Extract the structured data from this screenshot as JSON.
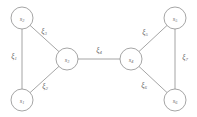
{
  "figure": {
    "type": "undirected-graph-diagram",
    "width": 197,
    "height": 117,
    "background_color": "#ffffff",
    "stroke_color": "#8e8e8e",
    "text_color": "#6a6a6a"
  },
  "nodes": [
    {
      "id": "s1",
      "base": "s",
      "subscript": "1",
      "label": "s₁",
      "x": 22,
      "y": 100,
      "r": 11
    },
    {
      "id": "s2",
      "base": "s",
      "subscript": "2",
      "label": "s₂",
      "x": 22,
      "y": 18,
      "r": 11
    },
    {
      "id": "s3",
      "base": "s",
      "subscript": "3",
      "label": "s₃",
      "x": 67,
      "y": 59,
      "r": 11
    },
    {
      "id": "s4",
      "base": "s",
      "subscript": "4",
      "label": "s₄",
      "x": 131,
      "y": 59,
      "r": 11
    },
    {
      "id": "s5",
      "base": "s",
      "subscript": "5",
      "label": "s₅",
      "x": 175,
      "y": 18,
      "r": 11
    },
    {
      "id": "s6",
      "base": "s",
      "subscript": "6",
      "label": "s₆",
      "x": 175,
      "y": 100,
      "r": 11
    }
  ],
  "edges": [
    {
      "id": "e1",
      "base": "ξ",
      "subscript": "1",
      "label": "ξ₁",
      "source": "s1",
      "target": "s2",
      "label_x": 14,
      "label_y": 56
    },
    {
      "id": "e2",
      "base": "ξ",
      "subscript": "2",
      "label": "ξ₂",
      "source": "s1",
      "target": "s3",
      "label_x": 45,
      "label_y": 86
    },
    {
      "id": "e3",
      "base": "ξ",
      "subscript": "3",
      "label": "ξ₃",
      "source": "s2",
      "target": "s3",
      "label_x": 44,
      "label_y": 31
    },
    {
      "id": "e4",
      "base": "ξ",
      "subscript": "4",
      "label": "ξ₄",
      "source": "s3",
      "target": "s4",
      "label_x": 99,
      "label_y": 50
    },
    {
      "id": "e5",
      "base": "ξ",
      "subscript": "5",
      "label": "ξ₅",
      "source": "s4",
      "target": "s5",
      "label_x": 145,
      "label_y": 32
    },
    {
      "id": "e6",
      "base": "ξ",
      "subscript": "6",
      "label": "ξ₆",
      "source": "s4",
      "target": "s6",
      "label_x": 144,
      "label_y": 85
    },
    {
      "id": "e7",
      "base": "ξ",
      "subscript": "7",
      "label": "ξ₇",
      "source": "s5",
      "target": "s6",
      "label_x": 185,
      "label_y": 57
    }
  ]
}
